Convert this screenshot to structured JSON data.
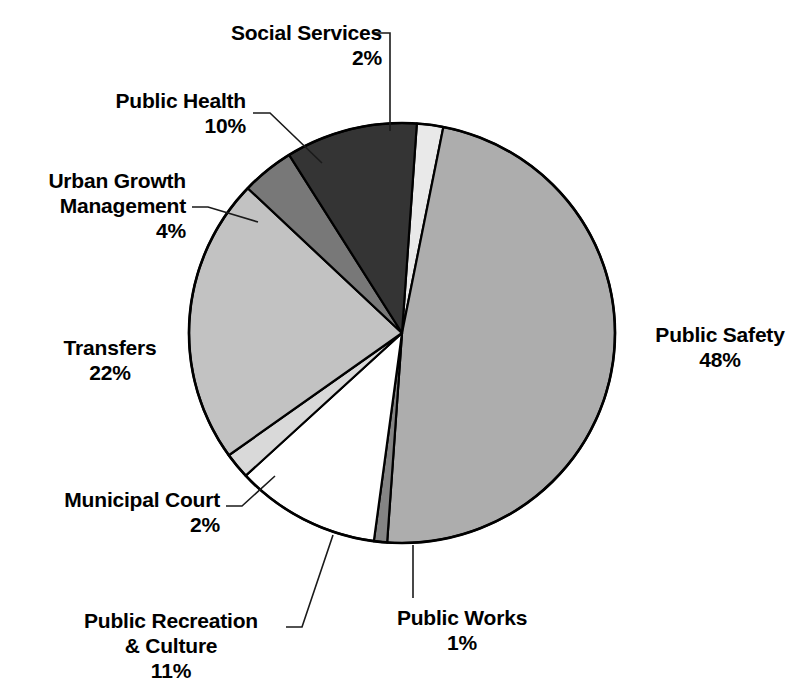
{
  "chart_data": {
    "type": "pie",
    "title": "",
    "subtitle": "",
    "xlabel": "",
    "ylabel": "",
    "legend_position": "none",
    "grid": false,
    "unit": "%",
    "start_angle_deg": -86,
    "direction": "clockwise",
    "categories": [
      "Social Services",
      "Public Safety",
      "Public Works",
      "Public Recreation & Culture",
      "Municipal Court",
      "Transfers",
      "Urban Growth Management",
      "Public Health"
    ],
    "values": [
      2,
      48,
      1,
      11,
      2,
      22,
      4,
      10
    ],
    "slices": [
      {
        "label": "Social Services",
        "value": 2,
        "percent_text": "2%",
        "color": "#e9e9e9"
      },
      {
        "label": "Public Safety",
        "value": 48,
        "percent_text": "48%",
        "color": "#adadad"
      },
      {
        "label": "Public Works",
        "value": 1,
        "percent_text": "1%",
        "color": "#848484"
      },
      {
        "label": "Public Recreation & Culture",
        "value": 11,
        "percent_text": "11%",
        "color": "#ffffff"
      },
      {
        "label": "Municipal Court",
        "value": 2,
        "percent_text": "2%",
        "color": "#d9d9d9"
      },
      {
        "label": "Transfers",
        "value": 22,
        "percent_text": "22%",
        "color": "#c2c2c2"
      },
      {
        "label": "Urban Growth Management",
        "value": 4,
        "percent_text": "4%",
        "color": "#787878"
      },
      {
        "label": "Public Health",
        "value": 10,
        "percent_text": "10%",
        "color": "#343434"
      }
    ]
  },
  "labels": {
    "social_services": {
      "name": "Social Services",
      "pct": "2%"
    },
    "public_health": {
      "name": "Public Health",
      "pct": "10%"
    },
    "urban_growth": {
      "name_line1": "Urban Growth",
      "name_line2": "Management",
      "pct": "4%"
    },
    "transfers": {
      "name": "Transfers",
      "pct": "22%"
    },
    "municipal_court": {
      "name": "Municipal Court",
      "pct": "2%"
    },
    "public_recreation": {
      "name_line1": "Public Recreation",
      "name_line2": "& Culture",
      "pct": "11%"
    },
    "public_works": {
      "name": "Public Works",
      "pct": "1%"
    },
    "public_safety": {
      "name": "Public Safety",
      "pct": "48%"
    }
  },
  "style": {
    "outline_color": "#000000",
    "background": "#ffffff",
    "leader_color": "#1a1a1a"
  }
}
